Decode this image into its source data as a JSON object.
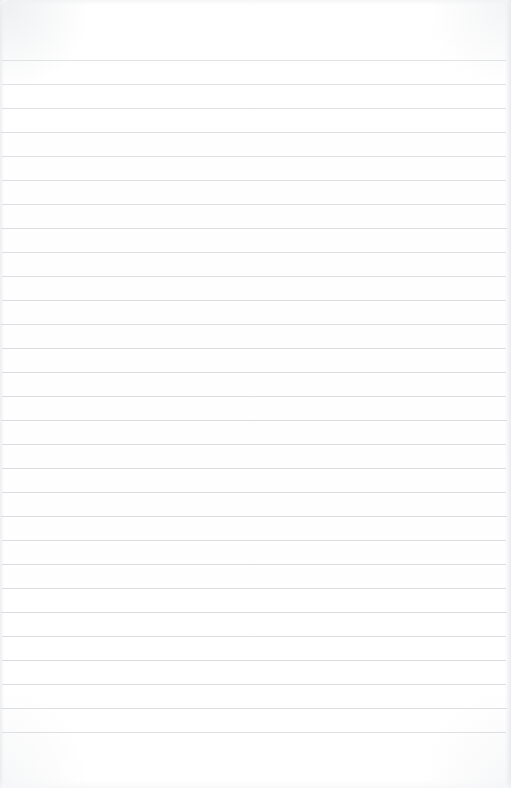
{
  "page": {
    "kind": "scanned-blank-lined-notebook-page",
    "width": 511,
    "height": 788,
    "paper_color": "#ffffff",
    "rule_color": "#d6d9dd",
    "text_content": "",
    "written_text": []
  },
  "ruling": {
    "line_count": 29,
    "first_line_y": 60,
    "line_spacing": 24,
    "line_thickness": 1,
    "left_inset": 2,
    "right_inset": 5,
    "top_margin_height": 60,
    "bottom_margin_height": 56,
    "lines": [
      {
        "index": 1,
        "y": 60,
        "x_start": 2,
        "x_end": 506,
        "opacity": 0.72
      },
      {
        "index": 2,
        "y": 84,
        "x_start": 2,
        "x_end": 506,
        "opacity": 0.78
      },
      {
        "index": 3,
        "y": 108,
        "x_start": 2,
        "x_end": 506,
        "opacity": 0.8
      },
      {
        "index": 4,
        "y": 132,
        "x_start": 1,
        "x_end": 506,
        "opacity": 0.82
      },
      {
        "index": 5,
        "y": 156,
        "x_start": 2,
        "x_end": 506,
        "opacity": 0.8
      },
      {
        "index": 6,
        "y": 180,
        "x_start": 2,
        "x_end": 506,
        "opacity": 0.84
      },
      {
        "index": 7,
        "y": 204,
        "x_start": 2,
        "x_end": 506,
        "opacity": 0.82
      },
      {
        "index": 8,
        "y": 228,
        "x_start": 1,
        "x_end": 507,
        "opacity": 0.86
      },
      {
        "index": 9,
        "y": 252,
        "x_start": 2,
        "x_end": 506,
        "opacity": 0.84
      },
      {
        "index": 10,
        "y": 276,
        "x_start": 2,
        "x_end": 506,
        "opacity": 0.86
      },
      {
        "index": 11,
        "y": 300,
        "x_start": 2,
        "x_end": 506,
        "opacity": 0.88
      },
      {
        "index": 12,
        "y": 324,
        "x_start": 1,
        "x_end": 507,
        "opacity": 0.86
      },
      {
        "index": 13,
        "y": 348,
        "x_start": 2,
        "x_end": 506,
        "opacity": 0.88
      },
      {
        "index": 14,
        "y": 372,
        "x_start": 2,
        "x_end": 506,
        "opacity": 0.9
      },
      {
        "index": 15,
        "y": 396,
        "x_start": 2,
        "x_end": 506,
        "opacity": 0.88
      },
      {
        "index": 16,
        "y": 420,
        "x_start": 1,
        "x_end": 507,
        "opacity": 0.9
      },
      {
        "index": 17,
        "y": 444,
        "x_start": 2,
        "x_end": 506,
        "opacity": 0.88
      },
      {
        "index": 18,
        "y": 468,
        "x_start": 2,
        "x_end": 506,
        "opacity": 0.9
      },
      {
        "index": 19,
        "y": 492,
        "x_start": 2,
        "x_end": 506,
        "opacity": 0.88
      },
      {
        "index": 20,
        "y": 516,
        "x_start": 1,
        "x_end": 507,
        "opacity": 0.9
      },
      {
        "index": 21,
        "y": 540,
        "x_start": 2,
        "x_end": 506,
        "opacity": 0.88
      },
      {
        "index": 22,
        "y": 564,
        "x_start": 2,
        "x_end": 506,
        "opacity": 0.9
      },
      {
        "index": 23,
        "y": 588,
        "x_start": 2,
        "x_end": 506,
        "opacity": 0.88
      },
      {
        "index": 24,
        "y": 612,
        "x_start": 1,
        "x_end": 507,
        "opacity": 0.9
      },
      {
        "index": 25,
        "y": 636,
        "x_start": 2,
        "x_end": 506,
        "opacity": 0.88
      },
      {
        "index": 26,
        "y": 660,
        "x_start": 2,
        "x_end": 506,
        "opacity": 0.9
      },
      {
        "index": 27,
        "y": 684,
        "x_start": 2,
        "x_end": 506,
        "opacity": 0.88
      },
      {
        "index": 28,
        "y": 708,
        "x_start": 1,
        "x_end": 507,
        "opacity": 0.86
      },
      {
        "index": 29,
        "y": 732,
        "x_start": 2,
        "x_end": 506,
        "opacity": 0.84
      }
    ]
  }
}
